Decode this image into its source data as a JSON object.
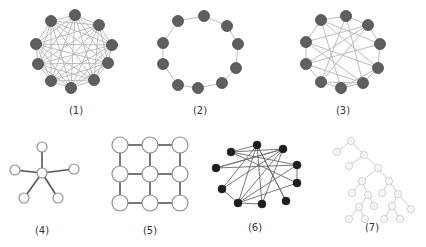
{
  "figure": {
    "background": "#ffffff",
    "colors": {
      "dense_node": "#5f5f5f",
      "dense_node_stroke": "#4a4a4a",
      "dense_edge": "#b5b5b5",
      "open_node_fill": "#ffffff",
      "open_node_stroke": "#8a8a8a",
      "dark_edge": "#555555",
      "black_node": "#1e1e1e",
      "tree_stroke": "#a8a8a8"
    },
    "panels": [
      {
        "id": "1",
        "caption": "(1)",
        "caption_pos": [
          76,
          113
        ],
        "topology": "fully connected / dense mesh",
        "node_style": "dense",
        "node_r": 5.5,
        "nodes": [
          [
            75,
            15
          ],
          [
            51,
            21
          ],
          [
            99,
            25
          ],
          [
            36,
            44
          ],
          [
            112,
            45
          ],
          [
            38,
            64
          ],
          [
            108,
            63
          ],
          [
            51,
            81
          ],
          [
            71,
            88
          ],
          [
            94,
            80
          ]
        ],
        "edges": "complete"
      },
      {
        "id": "2",
        "caption": "(2)",
        "caption_pos": [
          200,
          113
        ],
        "topology": "ring",
        "node_style": "dense",
        "node_r": 5.5,
        "nodes": [
          [
            204,
            16
          ],
          [
            178,
            21
          ],
          [
            227,
            26
          ],
          [
            163,
            43
          ],
          [
            238,
            44
          ],
          [
            163,
            64
          ],
          [
            236,
            68
          ],
          [
            178,
            85
          ],
          [
            198,
            88
          ],
          [
            222,
            83
          ]
        ],
        "edges": [
          [
            0,
            1
          ],
          [
            0,
            2
          ],
          [
            1,
            3
          ],
          [
            2,
            4
          ],
          [
            3,
            5
          ],
          [
            4,
            6
          ],
          [
            5,
            7
          ],
          [
            6,
            9
          ],
          [
            7,
            8
          ],
          [
            8,
            9
          ]
        ]
      },
      {
        "id": "3",
        "caption": "(3)",
        "caption_pos": [
          343,
          113
        ],
        "topology": "partially connected mesh",
        "node_style": "dense",
        "node_r": 5.5,
        "nodes": [
          [
            346,
            16
          ],
          [
            321,
            20
          ],
          [
            368,
            25
          ],
          [
            306,
            42
          ],
          [
            380,
            44
          ],
          [
            306,
            64
          ],
          [
            378,
            68
          ],
          [
            321,
            82
          ],
          [
            341,
            88
          ],
          [
            363,
            83
          ]
        ],
        "edges": [
          [
            0,
            1
          ],
          [
            0,
            2
          ],
          [
            1,
            3
          ],
          [
            2,
            4
          ],
          [
            3,
            5
          ],
          [
            4,
            6
          ],
          [
            5,
            7
          ],
          [
            6,
            9
          ],
          [
            7,
            8
          ],
          [
            8,
            9
          ],
          [
            0,
            7
          ],
          [
            0,
            9
          ],
          [
            1,
            4
          ],
          [
            1,
            8
          ],
          [
            2,
            3
          ],
          [
            2,
            7
          ],
          [
            3,
            6
          ],
          [
            3,
            9
          ],
          [
            4,
            5
          ],
          [
            5,
            9
          ],
          [
            6,
            8
          ],
          [
            7,
            9
          ],
          [
            1,
            6
          ],
          [
            2,
            5
          ]
        ]
      },
      {
        "id": "4",
        "caption": "(4)",
        "caption_pos": [
          42,
          233
        ],
        "topology": "star",
        "node_style": "open",
        "node_r": 5,
        "nodes": [
          [
            42,
            173
          ],
          [
            42,
            147
          ],
          [
            15,
            170
          ],
          [
            74,
            169
          ],
          [
            24,
            198
          ],
          [
            58,
            198
          ]
        ],
        "edges": [
          [
            0,
            1
          ],
          [
            0,
            2
          ],
          [
            0,
            3
          ],
          [
            0,
            4
          ],
          [
            0,
            5
          ]
        ]
      },
      {
        "id": "5",
        "caption": "(5)",
        "caption_pos": [
          150,
          233
        ],
        "topology": "grid / mesh 3x3",
        "node_style": "open",
        "node_r": 8,
        "nodes": [
          [
            120,
            145
          ],
          [
            150,
            145
          ],
          [
            180,
            145
          ],
          [
            120,
            174
          ],
          [
            150,
            174
          ],
          [
            180,
            174
          ],
          [
            120,
            203
          ],
          [
            150,
            203
          ],
          [
            180,
            203
          ]
        ],
        "edges": [
          [
            0,
            1
          ],
          [
            1,
            2
          ],
          [
            3,
            4
          ],
          [
            4,
            5
          ],
          [
            6,
            7
          ],
          [
            7,
            8
          ],
          [
            0,
            3
          ],
          [
            3,
            6
          ],
          [
            1,
            4
          ],
          [
            4,
            7
          ],
          [
            2,
            5
          ],
          [
            5,
            8
          ]
        ]
      },
      {
        "id": "6",
        "caption": "(6)",
        "caption_pos": [
          255,
          230
        ],
        "topology": "random / irregular",
        "node_style": "black",
        "node_r": 4,
        "nodes": [
          [
            257,
            145
          ],
          [
            231,
            152
          ],
          [
            283,
            149
          ],
          [
            216,
            168
          ],
          [
            297,
            165
          ],
          [
            222,
            189
          ],
          [
            297,
            183
          ],
          [
            238,
            203
          ],
          [
            262,
            204
          ],
          [
            286,
            201
          ]
        ],
        "edges": [
          [
            0,
            1
          ],
          [
            0,
            5
          ],
          [
            0,
            7
          ],
          [
            0,
            8
          ],
          [
            0,
            9
          ],
          [
            1,
            2
          ],
          [
            1,
            4
          ],
          [
            2,
            3
          ],
          [
            2,
            5
          ],
          [
            2,
            7
          ],
          [
            2,
            8
          ],
          [
            3,
            4
          ],
          [
            5,
            7
          ],
          [
            6,
            7
          ],
          [
            6,
            4
          ],
          [
            7,
            8
          ],
          [
            4,
            7
          ],
          [
            1,
            6
          ],
          [
            9,
            0
          ],
          [
            3,
            2
          ]
        ]
      },
      {
        "id": "7",
        "caption": "(7)",
        "caption_pos": [
          372,
          230
        ],
        "topology": "binary tree",
        "node_style": "tree",
        "node_r": 3.5,
        "nodes": [
          [
            351,
            141
          ],
          [
            337,
            152
          ],
          [
            364,
            155
          ],
          [
            349,
            166
          ],
          [
            378,
            168
          ],
          [
            362,
            181
          ],
          [
            389,
            181
          ],
          [
            352,
            193
          ],
          [
            368,
            195
          ],
          [
            382,
            193
          ],
          [
            398,
            194
          ],
          [
            359,
            207
          ],
          [
            374,
            206
          ],
          [
            392,
            206
          ],
          [
            411,
            209
          ],
          [
            349,
            219
          ],
          [
            365,
            219
          ],
          [
            384,
            219
          ],
          [
            400,
            219
          ]
        ],
        "edges": [
          [
            0,
            1
          ],
          [
            0,
            2
          ],
          [
            2,
            3
          ],
          [
            2,
            4
          ],
          [
            4,
            5
          ],
          [
            4,
            6
          ],
          [
            5,
            7
          ],
          [
            5,
            8
          ],
          [
            6,
            9
          ],
          [
            6,
            10
          ],
          [
            8,
            11
          ],
          [
            8,
            12
          ],
          [
            10,
            13
          ],
          [
            10,
            14
          ],
          [
            11,
            15
          ],
          [
            11,
            16
          ],
          [
            13,
            17
          ],
          [
            13,
            18
          ]
        ]
      }
    ]
  }
}
